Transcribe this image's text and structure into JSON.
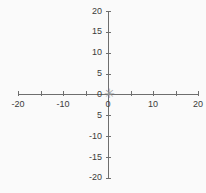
{
  "figure": {
    "background_color": "#fafafa",
    "axis_color": "#6e6e6e",
    "label_color": "#3a3a3a",
    "marker_color": "#9a9a9a",
    "marker_glyph": "✳"
  },
  "chart_data": {
    "type": "scatter",
    "title": "",
    "subtitle": "",
    "xlabel": "",
    "ylabel": "",
    "xlim": [
      -20,
      20
    ],
    "ylim": [
      -20,
      20
    ],
    "grid": false,
    "legend": null,
    "x_tick_values": [
      -20,
      -15,
      -10,
      -5,
      0,
      5,
      10,
      15,
      20
    ],
    "x_tick_labels": [
      "-20",
      "",
      "-10",
      "",
      "0",
      "",
      "10",
      "",
      "20"
    ],
    "y_tick_values": [
      20,
      15,
      10,
      5,
      0,
      -5,
      -10,
      -15,
      -20
    ],
    "y_tick_labels": [
      "20",
      "15",
      "10",
      "5",
      "0",
      "5",
      "-10",
      "-15",
      "-20"
    ],
    "series": [
      {
        "name": "point",
        "marker": "asterisk",
        "color": "#9a9a9a",
        "points": [
          {
            "x": 0,
            "y": 0
          }
        ]
      }
    ],
    "annotations": []
  },
  "x_axis": {
    "ticks": [
      {
        "value": -20,
        "label": "-20",
        "px": 18,
        "labeled": true
      },
      {
        "value": -15,
        "label": "",
        "px": 40.5,
        "labeled": false
      },
      {
        "value": -10,
        "label": "-10",
        "px": 63,
        "labeled": true
      },
      {
        "value": -5,
        "label": "",
        "px": 85.5,
        "labeled": false
      },
      {
        "value": 0,
        "label": "0",
        "px": 108,
        "labeled": true
      },
      {
        "value": 5,
        "label": "",
        "px": 130.5,
        "labeled": false
      },
      {
        "value": 10,
        "label": "10",
        "px": 153,
        "labeled": true
      },
      {
        "value": 15,
        "label": "",
        "px": 175.5,
        "labeled": false
      },
      {
        "value": 20,
        "label": "20",
        "px": 198,
        "labeled": true
      }
    ]
  },
  "y_axis": {
    "ticks": [
      {
        "value": 20,
        "label": "20",
        "px": 11,
        "labeled": true
      },
      {
        "value": 15,
        "label": "15",
        "px": 31.9,
        "labeled": true
      },
      {
        "value": 10,
        "label": "10",
        "px": 52.7,
        "labeled": true
      },
      {
        "value": 5,
        "label": "5",
        "px": 73.6,
        "labeled": true
      },
      {
        "value": 0,
        "label": "0",
        "px": 94,
        "labeled": true
      },
      {
        "value": -5,
        "label": "5",
        "px": 115.3,
        "labeled": true
      },
      {
        "value": -10,
        "label": "-10",
        "px": 136.1,
        "labeled": true
      },
      {
        "value": -15,
        "label": "-15",
        "px": 157,
        "labeled": true
      },
      {
        "value": -20,
        "label": "-20",
        "px": 177.8,
        "labeled": true
      }
    ]
  },
  "marker": {
    "glyph": "✳",
    "x_px": 109,
    "y_px": 94
  }
}
